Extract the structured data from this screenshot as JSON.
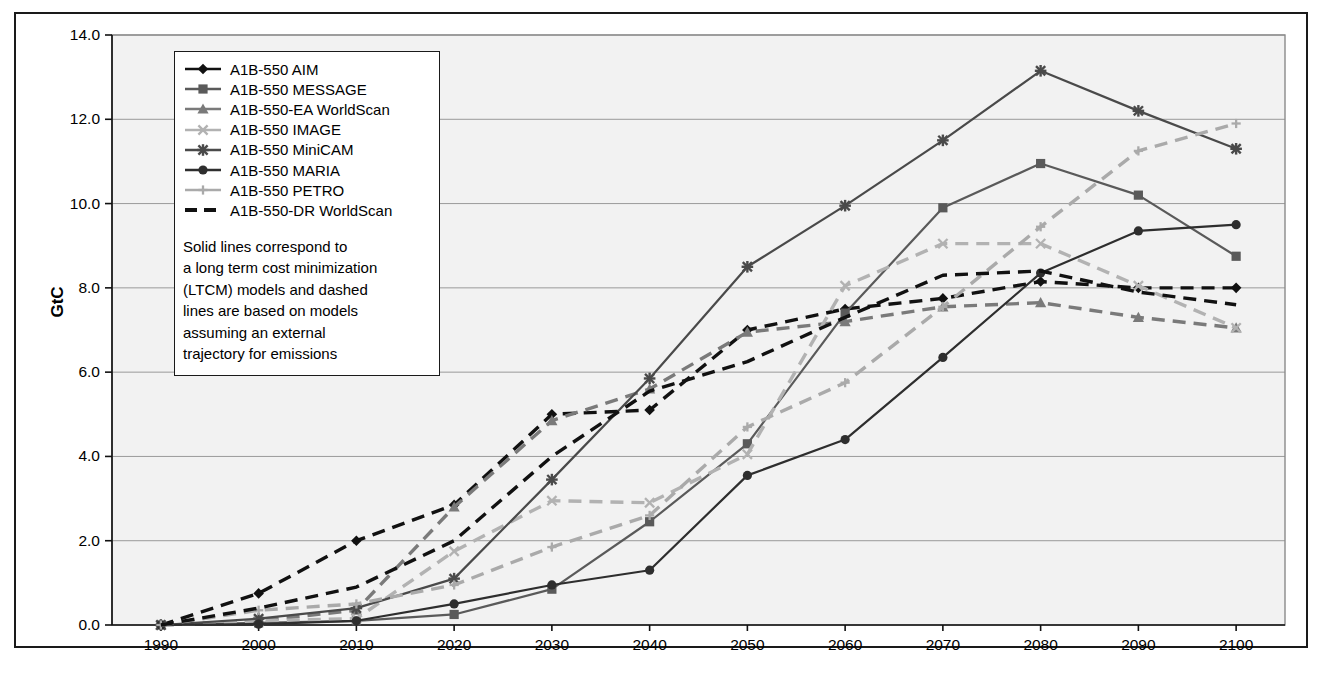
{
  "figure": {
    "y_axis_title": "GtC"
  },
  "legend": {
    "items": [
      {
        "label": "A1B-550 AIM",
        "marker": "diamond",
        "dash": "solid",
        "color": "#111111",
        "key_name": "legend-key-aim"
      },
      {
        "label": "A1B-550 MESSAGE",
        "marker": "square",
        "dash": "solid",
        "color": "#5a5a5a",
        "key_name": "legend-key-message"
      },
      {
        "label": "A1B-550-EA WorldScan",
        "marker": "triangle",
        "dash": "solid",
        "color": "#7a7a7a",
        "key_name": "legend-key-ea-worldscan"
      },
      {
        "label": "A1B-550 IMAGE",
        "marker": "x",
        "dash": "solid",
        "color": "#b2b2b2",
        "key_name": "legend-key-image"
      },
      {
        "label": "A1B-550 MiniCAM",
        "marker": "star",
        "dash": "solid",
        "color": "#4a4a4a",
        "key_name": "legend-key-minicam"
      },
      {
        "label": "A1B-550 MARIA",
        "marker": "circle",
        "dash": "solid",
        "color": "#2e2e2e",
        "key_name": "legend-key-maria"
      },
      {
        "label": "A1B-550 PETRO",
        "marker": "plus",
        "dash": "solid",
        "color": "#aaaaaa",
        "key_name": "legend-key-petro"
      },
      {
        "label": "A1B-550-DR WorldScan",
        "marker": "none",
        "dash": "dash",
        "color": "#111111",
        "key_name": "legend-key-dr-worldscan"
      }
    ],
    "note_lines": [
      "Solid lines correspond to",
      "a long term cost minimization",
      "(LTCM) models and dashed",
      "lines are based on models",
      "assuming an external",
      "trajectory for emissions"
    ]
  },
  "chart_data": {
    "type": "line",
    "title": "",
    "xlabel": "",
    "ylabel": "GtC",
    "x": [
      1990,
      2000,
      2010,
      2020,
      2030,
      2040,
      2050,
      2060,
      2070,
      2080,
      2090,
      2100
    ],
    "xtick_labels": [
      "1990",
      "2000",
      "2010",
      "2020",
      "2030",
      "2040",
      "2050",
      "2060",
      "2070",
      "2080",
      "2090",
      "2100"
    ],
    "ytick_labels": [
      "0.0",
      "2.0",
      "4.0",
      "6.0",
      "8.0",
      "10.0",
      "12.0",
      "14.0"
    ],
    "ytick_values": [
      0.0,
      2.0,
      4.0,
      6.0,
      8.0,
      10.0,
      12.0,
      14.0
    ],
    "ylim": [
      0.0,
      14.0
    ],
    "xlim": [
      1985,
      2105
    ],
    "grid": "horizontal",
    "legend_position": "upper-left-inside",
    "series": [
      {
        "name": "A1B-550 AIM",
        "style": "dashed",
        "marker": "diamond",
        "color": "#111111",
        "values": [
          0.0,
          0.75,
          2.0,
          2.85,
          5.0,
          5.1,
          7.0,
          7.5,
          7.75,
          8.15,
          8.0,
          8.0
        ]
      },
      {
        "name": "A1B-550 MESSAGE",
        "style": "solid",
        "marker": "square",
        "color": "#5a5a5a",
        "values": [
          0.0,
          0.05,
          0.1,
          0.25,
          0.85,
          2.45,
          4.3,
          7.4,
          9.9,
          10.95,
          10.2,
          8.75
        ]
      },
      {
        "name": "A1B-550-EA WorldScan",
        "style": "dashed",
        "marker": "triangle",
        "color": "#7a7a7a",
        "values": [
          0.0,
          0.1,
          0.35,
          2.8,
          4.85,
          5.6,
          6.95,
          7.2,
          7.55,
          7.65,
          7.3,
          7.05
        ]
      },
      {
        "name": "A1B-550 IMAGE",
        "style": "dashed",
        "marker": "x",
        "color": "#b2b2b2",
        "values": [
          0.0,
          0.1,
          0.15,
          1.75,
          2.95,
          2.9,
          4.05,
          8.05,
          9.05,
          9.05,
          8.05,
          7.05
        ]
      },
      {
        "name": "A1B-550 MiniCAM",
        "style": "solid",
        "marker": "star",
        "color": "#4a4a4a",
        "values": [
          0.0,
          0.15,
          0.4,
          1.1,
          3.45,
          5.85,
          8.5,
          9.95,
          11.5,
          13.15,
          12.2,
          11.3
        ]
      },
      {
        "name": "A1B-550 MARIA",
        "style": "solid",
        "marker": "circle",
        "color": "#2e2e2e",
        "values": [
          0.0,
          0.02,
          0.1,
          0.5,
          0.95,
          1.3,
          3.55,
          4.4,
          6.35,
          8.35,
          9.35,
          9.5
        ]
      },
      {
        "name": "A1B-550 PETRO",
        "style": "dashed",
        "marker": "plus",
        "color": "#aaaaaa",
        "values": [
          0.0,
          0.35,
          0.5,
          0.95,
          1.85,
          2.6,
          4.7,
          5.75,
          7.55,
          9.45,
          11.25,
          11.9
        ]
      },
      {
        "name": "A1B-550-DR WorldScan",
        "style": "dashed",
        "marker": "none",
        "color": "#111111",
        "values": [
          0.0,
          0.4,
          0.9,
          2.0,
          4.0,
          5.55,
          6.25,
          7.3,
          8.3,
          8.4,
          7.9,
          7.6
        ]
      }
    ]
  }
}
